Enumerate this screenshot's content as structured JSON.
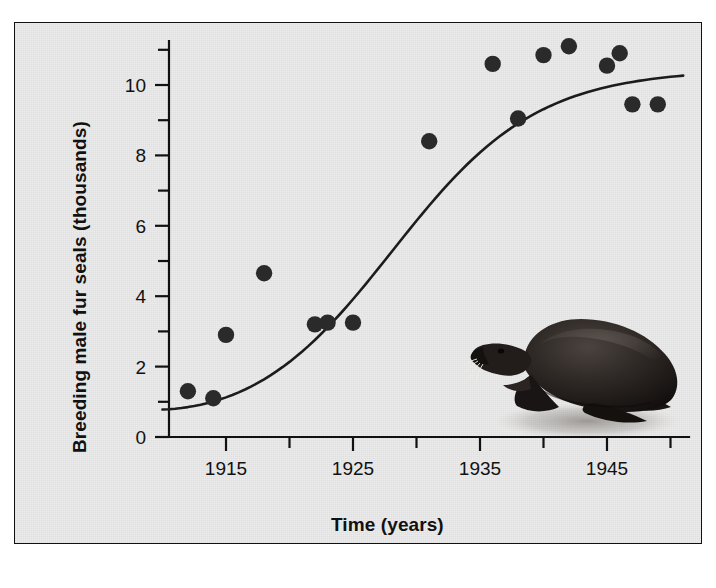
{
  "figure": {
    "background_color": "#ececec",
    "border_color": "#111111",
    "ink_color": "#1c1c1c"
  },
  "axes": {
    "y_title": "Breeding male fur seals (thousands)",
    "x_title": "Time (years)",
    "y_tick_labels": [
      "0",
      "2",
      "4",
      "6",
      "8",
      "10"
    ],
    "x_tick_labels": [
      "1915",
      "1925",
      "1935",
      "1945"
    ]
  },
  "illustration": {
    "name": "fur-seal-illustration",
    "subject": "northern fur seal bull",
    "body_color": "#241f1d",
    "shadow_color": "#b4b0ab"
  },
  "chart_data": {
    "type": "scatter",
    "title": "",
    "subtitle": "",
    "xlabel": "Time (years)",
    "ylabel": "Breeding male fur seals (thousands)",
    "xlim": [
      1910,
      1951
    ],
    "ylim": [
      0,
      11.6
    ],
    "grid": false,
    "legend": null,
    "x_ticks_major": [
      1915,
      1925,
      1935,
      1945
    ],
    "x_ticks_minor": [
      1920,
      1930,
      1940,
      1950
    ],
    "y_ticks_major": [
      0,
      2,
      4,
      6,
      8,
      10
    ],
    "y_ticks_minor": [
      1,
      3,
      5,
      7,
      9,
      11
    ],
    "series": [
      {
        "name": "Observed breeding males",
        "marker": "filled-circle",
        "color": "#2a2a2a",
        "x": [
          1912,
          1914,
          1915,
          1918,
          1922,
          1923,
          1925,
          1931,
          1936,
          1938,
          1940,
          1942,
          1945,
          1946,
          1947,
          1949
        ],
        "y": [
          1.3,
          1.1,
          2.9,
          4.65,
          3.2,
          3.25,
          3.25,
          8.4,
          10.6,
          9.05,
          10.85,
          11.1,
          10.55,
          10.9,
          9.45,
          9.45
        ]
      },
      {
        "name": "Logistic growth curve",
        "marker": "none",
        "line": "solid",
        "color": "#1c1c1c",
        "model": "logistic",
        "carrying_capacity": 10.45,
        "midpoint_year": 1928,
        "growth_rate": 0.175,
        "x": [
          1910,
          1912,
          1914,
          1916,
          1918,
          1920,
          1922,
          1924,
          1926,
          1928,
          1930,
          1932,
          1934,
          1936,
          1938,
          1940,
          1942,
          1944,
          1946,
          1948,
          1950,
          1951
        ],
        "y": [
          1.05,
          1.25,
          1.55,
          1.95,
          2.45,
          3.1,
          3.95,
          5.0,
          6.1,
          7.2,
          8.2,
          9.0,
          9.6,
          9.95,
          10.15,
          10.3,
          10.38,
          10.42,
          10.44,
          10.45,
          10.45,
          10.45
        ]
      }
    ]
  }
}
